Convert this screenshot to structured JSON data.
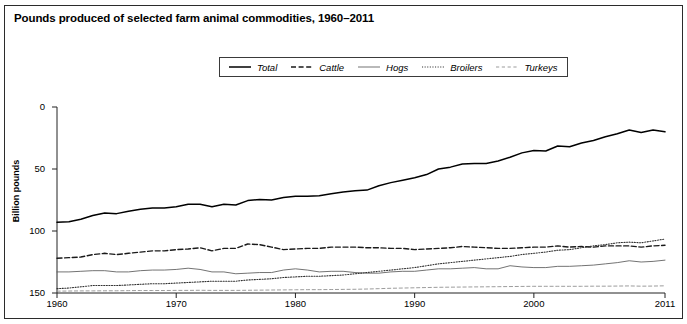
{
  "figure": {
    "title": "Pounds produced of selected farm animal commodities, 1960–2011",
    "frame_color": "#2b2b2b"
  },
  "axes": {
    "ylabel": "Billion pounds",
    "ytick_labels": [
      "150",
      "100",
      "50",
      "0"
    ],
    "xtick_labels": [
      "1960",
      "1970",
      "1980",
      "1990",
      "2000",
      "2011"
    ]
  },
  "legend": {
    "items": [
      {
        "label": "Total",
        "style": "solid-thick",
        "color": "#000000"
      },
      {
        "label": "Cattle",
        "style": "dashed",
        "color": "#1a1a1a"
      },
      {
        "label": "Hogs",
        "style": "solid-thin",
        "color": "#555555"
      },
      {
        "label": "Broilers",
        "style": "dotted",
        "color": "#333333"
      },
      {
        "label": "Turkeys",
        "style": "dashed-thin",
        "color": "#777777"
      }
    ]
  },
  "chart_data": {
    "type": "line",
    "title": "Pounds produced of selected farm animal commodities, 1960–2011",
    "xlabel": "",
    "ylabel": "Billion pounds",
    "xlim": [
      1960,
      2011
    ],
    "ylim": [
      0,
      150
    ],
    "yticks": [
      0,
      50,
      100,
      150
    ],
    "xticks": [
      1960,
      1970,
      1980,
      1990,
      2000,
      2011
    ],
    "grid": false,
    "legend_position": "top-center",
    "x": [
      1960,
      1961,
      1962,
      1963,
      1964,
      1965,
      1966,
      1967,
      1968,
      1969,
      1970,
      1971,
      1972,
      1973,
      1974,
      1975,
      1976,
      1977,
      1978,
      1979,
      1980,
      1981,
      1982,
      1983,
      1984,
      1985,
      1986,
      1987,
      1988,
      1989,
      1990,
      1991,
      1992,
      1993,
      1994,
      1995,
      1996,
      1997,
      1998,
      1999,
      2000,
      2001,
      2002,
      2003,
      2004,
      2005,
      2006,
      2007,
      2008,
      2009,
      2010,
      2011
    ],
    "series": [
      {
        "name": "Total",
        "style": "solid-thick",
        "values": [
          57,
          57.5,
          59.5,
          62.5,
          64.5,
          64,
          66,
          67.5,
          68.5,
          68.5,
          69.5,
          71.5,
          71.5,
          69.5,
          71.5,
          71,
          74.5,
          75.5,
          75,
          77,
          78,
          78,
          78.5,
          80,
          81.5,
          82.5,
          83,
          86.5,
          89,
          91,
          93,
          95.5,
          100,
          101.5,
          104,
          104.5,
          104.5,
          106.5,
          109.5,
          113,
          115,
          114.5,
          118.5,
          118,
          121,
          123,
          126,
          128.5,
          131.5,
          129.5,
          131.5,
          130
        ]
      },
      {
        "name": "Cattle",
        "style": "dashed",
        "values": [
          28,
          28.5,
          29,
          31,
          32,
          31,
          32,
          33,
          34,
          34,
          35,
          35.5,
          36.5,
          34,
          36,
          36,
          39.5,
          39,
          37,
          35,
          35.5,
          36,
          36,
          37,
          37,
          37,
          36.5,
          36.5,
          36,
          36,
          35,
          35.5,
          36,
          36.5,
          37.5,
          37,
          36.5,
          36,
          36,
          36.5,
          37,
          37,
          38,
          37,
          37.5,
          37,
          38,
          38,
          38,
          37,
          38,
          38.5
        ]
      },
      {
        "name": "Hogs",
        "style": "solid-thin",
        "values": [
          17,
          17,
          17.5,
          18,
          18,
          17,
          17,
          18,
          18.5,
          18.5,
          19,
          20,
          19,
          17,
          17,
          15.5,
          16,
          16.5,
          16.5,
          18.5,
          19.5,
          18.5,
          17,
          17.5,
          17.5,
          16.5,
          16,
          16,
          17,
          17.5,
          17.5,
          18.5,
          19.5,
          19.5,
          20,
          20.5,
          19.5,
          19.5,
          22,
          21,
          20.5,
          20.5,
          21.5,
          21.5,
          22,
          22.5,
          23.5,
          24.5,
          26,
          25,
          25.5,
          26.5
        ]
      },
      {
        "name": "Broilers",
        "style": "dotted",
        "values": [
          3.5,
          4,
          5,
          6,
          6,
          6,
          6.5,
          7,
          7.5,
          7.5,
          8,
          8.5,
          9,
          9.5,
          9.5,
          9.5,
          10.5,
          11,
          11.5,
          12.5,
          13,
          13.5,
          13.5,
          14,
          14.5,
          15.5,
          16.5,
          17.5,
          18.5,
          19.5,
          20.5,
          22,
          23.5,
          24.5,
          25.5,
          26.5,
          27.5,
          28.5,
          29.5,
          31,
          32,
          33,
          34.5,
          35,
          36.5,
          38,
          39,
          40.5,
          41,
          40.5,
          42,
          43.5
        ]
      },
      {
        "name": "Turkeys",
        "style": "dashed-thin",
        "values": [
          1.5,
          1.6,
          1.7,
          1.7,
          1.8,
          1.8,
          1.9,
          2.0,
          2.0,
          2.0,
          2.1,
          2.1,
          2.2,
          2.1,
          2.1,
          2.1,
          2.2,
          2.3,
          2.4,
          2.5,
          2.6,
          2.7,
          2.7,
          2.8,
          2.9,
          3.0,
          3.2,
          3.5,
          3.8,
          4.0,
          4.2,
          4.4,
          4.6,
          4.7,
          4.8,
          4.9,
          5.0,
          5.1,
          5.2,
          5.3,
          5.4,
          5.4,
          5.4,
          5.4,
          5.4,
          5.5,
          5.5,
          5.6,
          5.7,
          5.5,
          5.6,
          5.8
        ]
      }
    ]
  }
}
